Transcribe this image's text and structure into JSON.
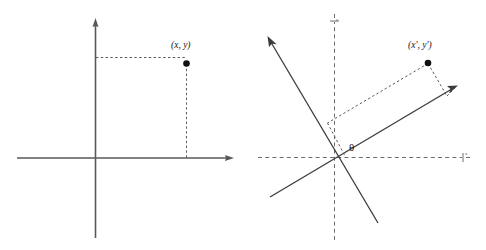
{
  "figure": {
    "kind": "geometry-diagram-pair",
    "background_color": "#ffffff",
    "line_color": "#58585a",
    "dash_color": "#6e6e70",
    "text_color": "#16161a",
    "dot_color": "#111113"
  },
  "panels": [
    {
      "id": "left",
      "name": "original-coordinate-system",
      "origin": {
        "x": 95,
        "y": 158
      },
      "axes": [
        {
          "name": "x-axis",
          "orientation": "horizontal",
          "style": "solid",
          "from": {
            "x": 17,
            "y": 158
          },
          "to": {
            "x": 232,
            "y": 158
          },
          "arrow": "end",
          "label": ""
        },
        {
          "name": "y-axis",
          "orientation": "vertical",
          "style": "solid",
          "from": {
            "x": 95,
            "y": 238
          },
          "to": {
            "x": 95,
            "y": 20
          },
          "arrow": "end",
          "label": ""
        }
      ],
      "point": {
        "name": "point-xy",
        "label": "(x, y)",
        "at": {
          "x": 186,
          "y": 64
        },
        "label_at": {
          "x": 172,
          "y": 48
        }
      },
      "projections": [
        {
          "name": "horizontal-projection",
          "style": "dashed",
          "from": {
            "x": 96,
            "y": 57
          },
          "to": {
            "x": 186,
            "y": 57
          }
        },
        {
          "name": "vertical-projection",
          "style": "dashed",
          "from": {
            "x": 186,
            "y": 64
          },
          "to": {
            "x": 186,
            "y": 158
          }
        }
      ]
    },
    {
      "id": "right",
      "name": "rotated-coordinate-system",
      "origin": {
        "x": 334,
        "y": 157
      },
      "axes": [
        {
          "name": "x-axis-reference",
          "orientation": "horizontal",
          "style": "dashed",
          "from": {
            "x": 258,
            "y": 157
          },
          "to": {
            "x": 466,
            "y": 157
          },
          "arrow": "tick",
          "label": "x"
        },
        {
          "name": "y-axis-reference",
          "orientation": "vertical",
          "style": "dashed",
          "from": {
            "x": 334,
            "y": 240
          },
          "to": {
            "x": 334,
            "y": 16
          },
          "arrow": "tick",
          "label": "y"
        },
        {
          "name": "x-prime-axis",
          "orientation": "rotated",
          "style": "solid",
          "from": {
            "x": 270,
            "y": 197
          },
          "to": {
            "x": 457,
            "y": 86
          },
          "arrow": "end",
          "label": ""
        },
        {
          "name": "y-prime-axis",
          "orientation": "rotated",
          "style": "solid",
          "from": {
            "x": 378,
            "y": 223
          },
          "to": {
            "x": 268,
            "y": 37
          },
          "arrow": "end",
          "label": ""
        }
      ],
      "point": {
        "name": "point-x-prime-y-prime",
        "label": "(x', y')",
        "at": {
          "x": 428,
          "y": 63
        },
        "label_at": {
          "x": 409,
          "y": 48
        }
      },
      "projections": [
        {
          "name": "x-prime-parallel-projection",
          "style": "dashed",
          "from": {
            "x": 428,
            "y": 63
          },
          "to": {
            "x": 327,
            "y": 123
          }
        },
        {
          "name": "y-prime-parallel-projection",
          "style": "dashed",
          "from": {
            "x": 428,
            "y": 63
          },
          "to": {
            "x": 447,
            "y": 96
          }
        },
        {
          "name": "y-prime-foot-connector",
          "style": "dashed",
          "from": {
            "x": 327,
            "y": 123
          },
          "to": {
            "x": 345,
            "y": 156
          }
        },
        {
          "name": "x-prime-foot-connector",
          "style": "dashed",
          "from": {
            "x": 447,
            "y": 96
          },
          "to": {
            "x": 457,
            "y": 87
          }
        }
      ],
      "angle": {
        "name": "rotation-angle",
        "label": "θ",
        "label_at": {
          "x": 352,
          "y": 150
        },
        "vertex": {
          "x": 334,
          "y": 157
        }
      }
    }
  ]
}
